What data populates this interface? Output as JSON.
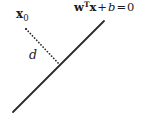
{
  "figure": {
    "background_color": "#ffffff",
    "stroke_color": "#2b2b2b",
    "width": 149,
    "height": 116
  },
  "labels": {
    "point_vector": "x",
    "point_subscript": "0",
    "distance": "d",
    "hyperplane": {
      "weight_vector": "w",
      "transpose": "T",
      "input_vector": "x",
      "plus": "+",
      "bias": "b",
      "equals": "=",
      "rhs": "0"
    }
  },
  "chart_data": {
    "type": "scatter",
    "title": "",
    "xlabel": "",
    "ylabel": "",
    "xlim": [
      0,
      149
    ],
    "ylim": [
      0,
      116
    ],
    "grid": false,
    "legend": null,
    "elements": [
      {
        "name": "hyperplane-line",
        "kind": "line",
        "style": "solid",
        "stroke_width": 1.8,
        "color": "#2b2b2b",
        "x1": 13,
        "y1": 112,
        "x2": 104,
        "y2": 21
      },
      {
        "name": "distance-segment",
        "kind": "line",
        "style": "dotted",
        "stroke_width": 1.7,
        "color": "#2b2b2b",
        "x1": 26,
        "y1": 29,
        "x2": 60,
        "y2": 65
      },
      {
        "name": "point-x0",
        "kind": "point",
        "x": 26,
        "y": 29,
        "color": "#2b2b2b",
        "radius": 1.1
      }
    ],
    "annotations": [
      {
        "name": "x0-label",
        "text": "x₀",
        "x": 16,
        "y": 8
      },
      {
        "name": "d-label",
        "text": "d",
        "x": 29,
        "y": 49
      },
      {
        "name": "hyperplane-label",
        "text": "wᵀx + b = 0",
        "x": 74,
        "y": 1
      }
    ]
  }
}
